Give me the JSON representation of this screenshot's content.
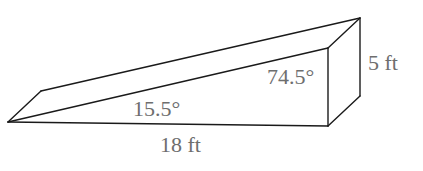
{
  "figure": {
    "type": "wedge-ramp-prism",
    "vertices": {
      "front_apex": [
        8,
        122
      ],
      "back_apex": [
        41,
        91
      ],
      "front_top_right": [
        328,
        48
      ],
      "back_top_right": [
        360,
        18
      ],
      "front_bottom_right": [
        328,
        126
      ],
      "back_bottom_right": [
        360,
        96
      ]
    },
    "labels": {
      "angle_left": "15.5°",
      "angle_right": "74.5°",
      "base_length": "18 ft",
      "height": "5 ft"
    },
    "colors": {
      "line": "#1a1a1a",
      "text": "#6e6e6e",
      "background": "#ffffff"
    }
  }
}
